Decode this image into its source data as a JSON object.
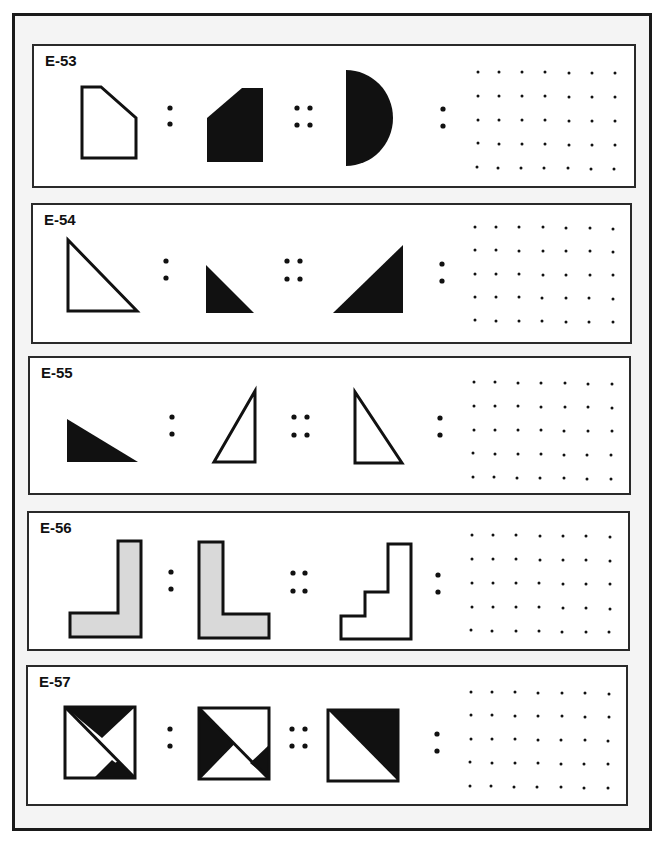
{
  "page": {
    "colors": {
      "ink": "#111111",
      "gray_fill": "#d9d9d9",
      "frame_bg": "#f4f4f4",
      "panel_bg": "#ffffff"
    }
  },
  "problems": [
    {
      "id": "E-53",
      "label": "E-53",
      "figures": [
        "pentagon-outline-clipped-top-right",
        "pentagon-filled-clipped-top-left",
        "half-disc-filled-right"
      ],
      "answer_grid": {
        "rows": 5,
        "cols": 7
      }
    },
    {
      "id": "E-54",
      "label": "E-54",
      "figures": [
        "right-triangle-outline-large",
        "right-triangle-filled-small",
        "right-triangle-filled-large-mirrored"
      ],
      "answer_grid": {
        "rows": 5,
        "cols": 7
      }
    },
    {
      "id": "E-55",
      "label": "E-55",
      "figures": [
        "right-triangle-filled-horizontal",
        "right-triangle-outline-vertical",
        "right-triangle-outline-vertical-mirrored"
      ],
      "answer_grid": {
        "rows": 5,
        "cols": 7
      }
    },
    {
      "id": "E-56",
      "label": "E-56",
      "figures": [
        "l-shape-gray-reversed",
        "l-shape-gray",
        "staircase-outline"
      ],
      "answer_grid": {
        "rows": 5,
        "cols": 7
      }
    },
    {
      "id": "E-57",
      "label": "E-57",
      "figures": [
        "square-hourglass-triangles",
        "square-rotated-triangles",
        "square-diagonal-half-filled"
      ],
      "answer_grid": {
        "rows": 5,
        "cols": 7
      }
    }
  ],
  "symbols": {
    "ratio": ":",
    "proportion": "::"
  }
}
